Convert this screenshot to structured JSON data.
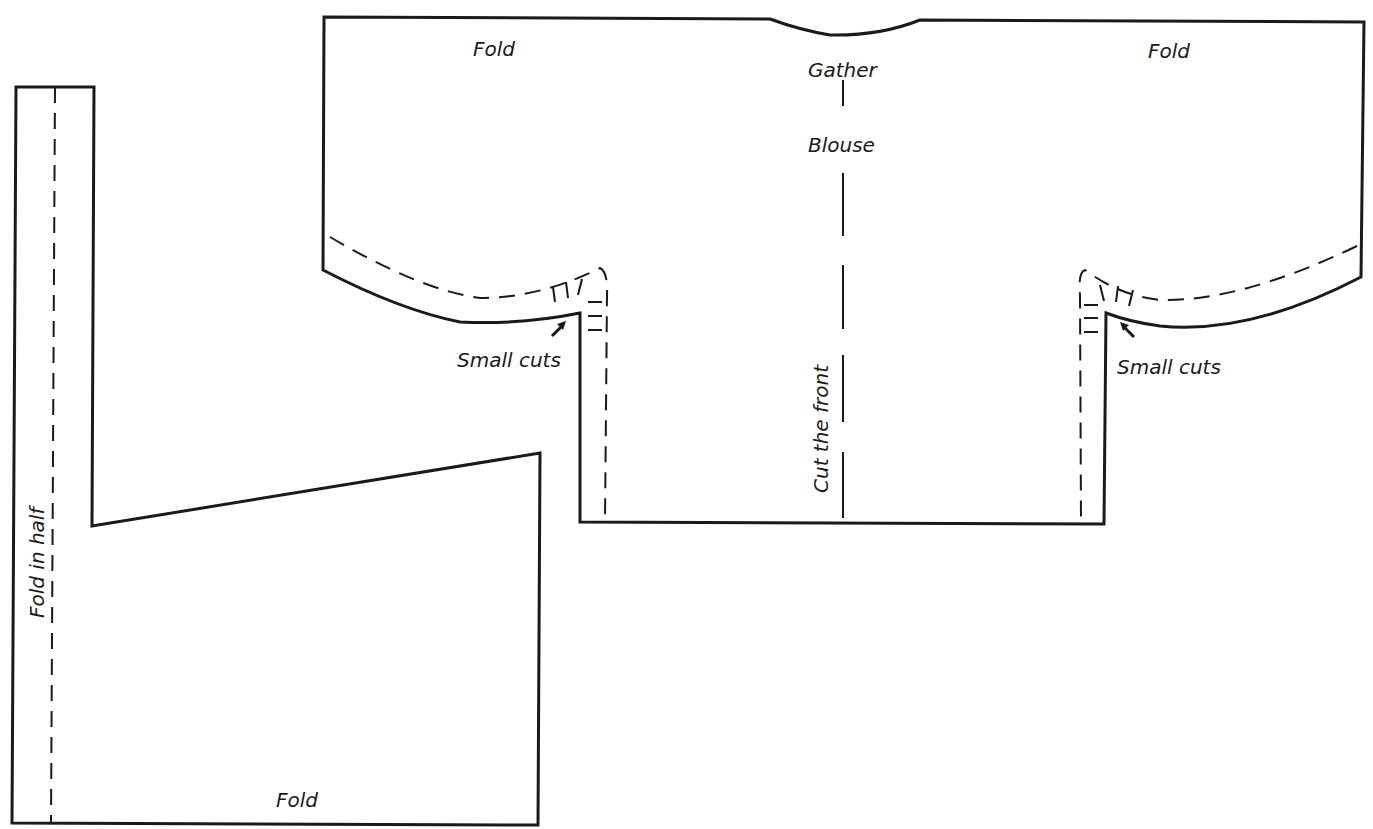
{
  "diagram": {
    "type": "sewing-pattern",
    "line_color": "#1a1a1a",
    "background": "#ffffff",
    "pieces": [
      {
        "name": "blouse",
        "labels": {
          "fold_left": "Fold",
          "fold_right": "Fold",
          "gather": "Gather",
          "title": "Blouse",
          "center": "Cut the front",
          "small_cuts_left": "Small cuts",
          "small_cuts_right": "Small cuts"
        }
      },
      {
        "name": "skirt",
        "labels": {
          "fold_side": "Fold in half",
          "fold_bottom": "Fold"
        }
      }
    ]
  }
}
